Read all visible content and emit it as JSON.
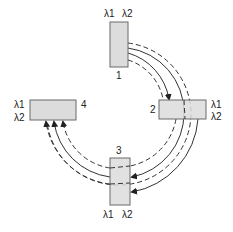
{
  "diagram": {
    "type": "wdm-ring-network",
    "nodes": [
      {
        "id": "1",
        "label": "1",
        "wavelengths": [
          "λ1",
          "λ2"
        ],
        "position": "top"
      },
      {
        "id": "2",
        "label": "2",
        "wavelengths": [
          "λ1",
          "λ2"
        ],
        "position": "right"
      },
      {
        "id": "3",
        "label": "3",
        "wavelengths": [
          "λ1",
          "λ2"
        ],
        "position": "bottom"
      },
      {
        "id": "4",
        "label": "4",
        "wavelengths": [
          "λ1",
          "λ2"
        ],
        "position": "left"
      }
    ],
    "connections": [
      {
        "from": "1",
        "to": "2",
        "style": "solid",
        "arrow": true
      },
      {
        "from": "1",
        "to": "3",
        "style": "solid",
        "arrow": true
      },
      {
        "from": "1",
        "to": "4",
        "style": "solid",
        "arrow": true
      },
      {
        "from": "1",
        "to": "4",
        "style": "dashed",
        "arrow": true
      },
      {
        "from": "2",
        "to": "4",
        "style": "dashed",
        "arrow": true
      },
      {
        "from": "2",
        "to": "3",
        "style": "dashed",
        "arrow": false
      }
    ],
    "colors": {
      "node_fill": "#dcdcdc",
      "node_stroke": "#6a6a6a",
      "line": "#333333"
    }
  }
}
